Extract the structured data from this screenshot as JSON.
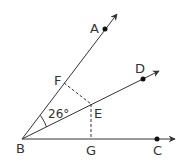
{
  "diagram": {
    "type": "geometry",
    "colors": {
      "line": "#333333",
      "background": "#ffffff"
    },
    "points": {
      "A": {
        "label": "A",
        "x": 105,
        "y": 29
      },
      "B": {
        "label": "B",
        "x": 22,
        "y": 139
      },
      "C": {
        "label": "C",
        "x": 157,
        "y": 139
      },
      "D": {
        "label": "D",
        "x": 143,
        "y": 79
      },
      "E": {
        "label": "E",
        "x": 91,
        "y": 104
      },
      "F": {
        "label": "F",
        "x": 64,
        "y": 83
      },
      "G": {
        "label": "G",
        "x": 91,
        "y": 139
      }
    },
    "rays": [
      "BA",
      "BD",
      "BC"
    ],
    "dashed_segments": [
      "EF",
      "EG"
    ],
    "angle": {
      "between": "ABD",
      "label": "26°"
    }
  }
}
